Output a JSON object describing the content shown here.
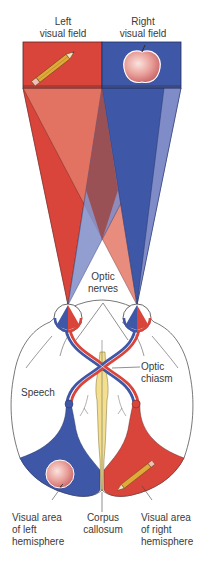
{
  "diagram": {
    "type": "visual-pathway-diagram",
    "colors": {
      "left_field_red": "#d9453a",
      "right_field_blue": "#3f57a7",
      "red_light": "#e47a68",
      "blue_light": "#7f8cc8",
      "overlap": "#9b4a4a",
      "corpus_callosum": "#f3df8e",
      "outline": "#555555",
      "background": "#ffffff"
    },
    "visual_fields": [
      {
        "label_line1": "Left",
        "label_line2": "visual field",
        "object": "pencil",
        "color": "red"
      },
      {
        "label_line1": "Right",
        "label_line2": "visual field",
        "object": "apple",
        "color": "blue"
      }
    ],
    "labels": {
      "optic_nerves_line1": "Optic",
      "optic_nerves_line2": "nerves",
      "optic_chiasm_line1": "Optic",
      "optic_chiasm_line2": "chiasm",
      "speech": "Speech",
      "visual_left_line1": "Visual area",
      "visual_left_line2": "of left",
      "visual_left_line3": "hemisphere",
      "corpus_line1": "Corpus",
      "corpus_line2": "callosum",
      "visual_right_line1": "Visual area",
      "visual_right_line2": "of right",
      "visual_right_line3": "hemisphere"
    },
    "hemisphere_contents": [
      {
        "side": "left",
        "object": "apple",
        "color": "blue"
      },
      {
        "side": "right",
        "object": "pencil",
        "color": "red"
      }
    ]
  }
}
